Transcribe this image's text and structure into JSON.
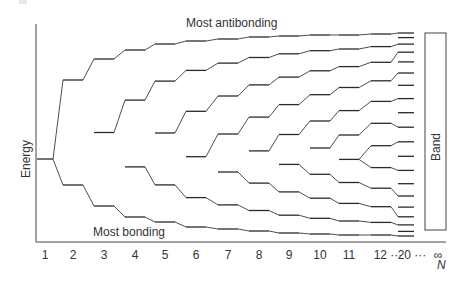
{
  "diagram": {
    "type": "molecular-orbital-band-formation",
    "y_axis_label": "Energy",
    "x_axis_label": "N",
    "top_annotation": "Most antibonding",
    "bottom_annotation": "Most bonding",
    "band_label": "Band",
    "tick_labels": [
      "1",
      "2",
      "3",
      "4",
      "5",
      "6",
      "7",
      "8",
      "9",
      "10",
      "11",
      "12 ···",
      "20 ···",
      "∞"
    ],
    "colors": {
      "line": "#2a2a2a",
      "text": "#333333",
      "background": "#ffffff"
    }
  },
  "chart_data": {
    "type": "diagram",
    "title": "",
    "xlabel": "N",
    "ylabel": "Energy",
    "categories": [
      "1",
      "2",
      "3",
      "4",
      "5",
      "6",
      "7",
      "8",
      "9",
      "10",
      "11",
      "12",
      "20",
      "∞"
    ],
    "levels_per_N": [
      1,
      2,
      3,
      4,
      5,
      6,
      7,
      8,
      9,
      10,
      11,
      12,
      20,
      "continuous band"
    ],
    "annotations": [
      "Most antibonding",
      "Most bonding",
      "Band"
    ]
  }
}
